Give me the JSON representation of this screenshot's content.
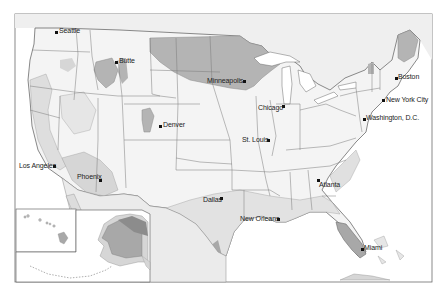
{
  "map": {
    "title": "United States",
    "colors": {
      "background": "#ffffff",
      "land_light": "#efefef",
      "land_lighter": "#f6f6f6",
      "zone_mid": "#d6d6d6",
      "zone_dark": "#a8a8a8",
      "zone_darker": "#8c8c8c",
      "border": "#6b6b6b",
      "water": "#ffffff"
    },
    "insets": [
      "Hawaii",
      "Alaska"
    ]
  },
  "cities": [
    {
      "name": "Seattle",
      "x": 56,
      "y": 32,
      "label_side": "right"
    },
    {
      "name": "Butte",
      "x": 116,
      "y": 62,
      "label_side": "right"
    },
    {
      "name": "Minneapolis",
      "x": 244,
      "y": 81,
      "label_side": "left"
    },
    {
      "name": "Boston",
      "x": 396,
      "y": 78,
      "label_side": "right"
    },
    {
      "name": "New York City",
      "x": 383,
      "y": 100,
      "label_side": "right"
    },
    {
      "name": "Chicago",
      "x": 283,
      "y": 106,
      "label_side": "left"
    },
    {
      "name": "Washington, D.C.",
      "x": 364,
      "y": 119,
      "label_side": "right"
    },
    {
      "name": "Denver",
      "x": 160,
      "y": 126,
      "label_side": "right"
    },
    {
      "name": "St. Louis",
      "x": 268,
      "y": 140,
      "label_side": "left"
    },
    {
      "name": "Los Angeles",
      "x": 54,
      "y": 166,
      "label_side": "left"
    },
    {
      "name": "Phoenix",
      "x": 100,
      "y": 180,
      "label_side": "left"
    },
    {
      "name": "Atlanta",
      "x": 318,
      "y": 180,
      "label_side": "right"
    },
    {
      "name": "Dallas",
      "x": 221,
      "y": 198,
      "label_side": "left"
    },
    {
      "name": "New Orleans",
      "x": 278,
      "y": 219,
      "label_side": "left"
    },
    {
      "name": "Miami",
      "x": 362,
      "y": 249,
      "label_side": "right"
    }
  ]
}
